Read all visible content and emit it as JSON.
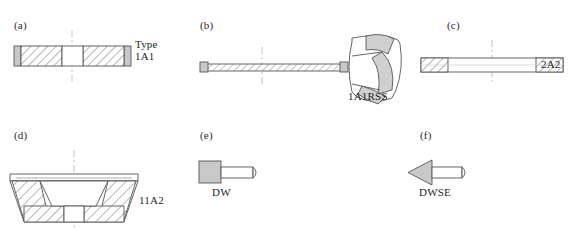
{
  "figure": {
    "panels": [
      {
        "id": "a",
        "letter": "(a)",
        "label_line1": "Type",
        "label_line2": "1A1",
        "label_full": "Type 1A1",
        "shape": "flat-straight-wheel-section"
      },
      {
        "id": "b",
        "letter": "(b)",
        "label_line1": "1A1RSS",
        "label_line2": "",
        "label_full": "1A1RSS",
        "shape": "thin-blade-with-segmented-sector"
      },
      {
        "id": "c",
        "letter": "(c)",
        "label_line1": "2A2",
        "label_line2": "",
        "label_full": "2A2",
        "shape": "flat-disc-rim-abrasive-section"
      },
      {
        "id": "d",
        "letter": "(d)",
        "label_line1": "11A2",
        "label_line2": "",
        "label_full": "11A2",
        "shape": "flaring-cup-wheel-section"
      },
      {
        "id": "e",
        "letter": "(e)",
        "label_line1": "DW",
        "label_line2": "",
        "label_full": "DW",
        "shape": "dressing-tool-block-with-shaft"
      },
      {
        "id": "f",
        "letter": "(f)",
        "label_line1": "DWSE",
        "label_line2": "",
        "label_full": "DWSE",
        "shape": "dressing-tool-arrowhead-with-shaft"
      }
    ],
    "colors": {
      "background": "#ffffff",
      "outline": "#555555",
      "hatch_line": "#6e6e6e",
      "body_fill": "#ffffff",
      "metal_fill": "#c9c9c9",
      "segment_fill": "#d0d0d0",
      "centerline": "#bdbdbd",
      "text": "#1f1f1f"
    }
  }
}
